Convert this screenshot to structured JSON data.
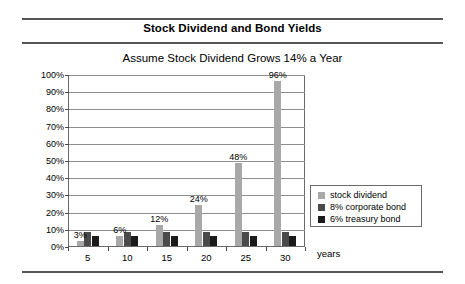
{
  "header": {
    "title": "Stock Dividend and Bond Yields"
  },
  "chart_data": {
    "type": "bar",
    "title": "Assume Stock Dividend Grows 14% a Year",
    "xlabel": "years",
    "ylabel": "",
    "ylim": [
      0,
      100
    ],
    "ytick_labels": [
      "0%",
      "10%",
      "20%",
      "30%",
      "40%",
      "50%",
      "60%",
      "70%",
      "80%",
      "90%",
      "100%"
    ],
    "ytick_values": [
      0,
      10,
      20,
      30,
      40,
      50,
      60,
      70,
      80,
      90,
      100
    ],
    "grid": true,
    "legend_position": "right",
    "categories": [
      "5",
      "10",
      "15",
      "20",
      "25",
      "30"
    ],
    "series": [
      {
        "name": "stock dividend",
        "color": "#a8a8a8",
        "values": [
          3,
          6,
          12,
          24,
          48,
          96
        ],
        "labels": [
          "3%",
          "6%",
          "12%",
          "24%",
          "48%",
          "96%"
        ]
      },
      {
        "name": "8% corporate bond",
        "color": "#4a4a4a",
        "values": [
          8,
          8,
          8,
          8,
          8,
          8
        ],
        "labels": [
          "",
          "",
          "",
          "",
          "",
          ""
        ]
      },
      {
        "name": "6% treasury bond",
        "color": "#1a1a1a",
        "values": [
          6,
          6,
          6,
          6,
          6,
          6
        ],
        "labels": [
          "",
          "",
          "",
          "",
          "",
          ""
        ]
      }
    ]
  }
}
